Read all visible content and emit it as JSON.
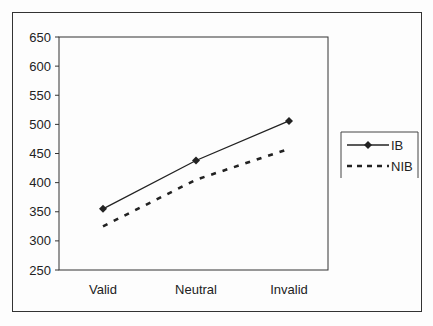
{
  "chart_data": {
    "type": "line",
    "title": "",
    "xlabel": "",
    "ylabel": "",
    "categories": [
      "Valid",
      "Neutral",
      "Invalid"
    ],
    "series": [
      {
        "name": "IB",
        "values": [
          355,
          438,
          506
        ],
        "style": "solid",
        "marker": "diamond",
        "color": "#222222"
      },
      {
        "name": "NIB",
        "values": [
          325,
          405,
          458
        ],
        "style": "dashed",
        "marker": "none",
        "color": "#222222"
      }
    ],
    "ylim": [
      250,
      650
    ],
    "yticks": [
      250,
      300,
      350,
      400,
      450,
      500,
      550,
      600,
      650
    ],
    "grid": false,
    "legend_position": "right"
  }
}
